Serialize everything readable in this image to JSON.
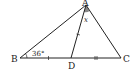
{
  "diagram": {
    "type": "geometry-triangle",
    "points": {
      "A": {
        "label": "A",
        "x": 86,
        "y": 5
      },
      "B": {
        "label": "B",
        "x": 20,
        "y": 58
      },
      "C": {
        "label": "C",
        "x": 121,
        "y": 58
      },
      "D": {
        "label": "D",
        "x": 71,
        "y": 58
      }
    },
    "segments": [
      "AB",
      "AC",
      "BC",
      "AD"
    ],
    "angle_labels": {
      "B": "36°",
      "A": "x"
    },
    "equal_marks": {
      "single_tick": [
        "AD",
        "BD"
      ],
      "double_tick": [
        "DC"
      ]
    },
    "colors": {
      "line": "#222222",
      "shade": "#888888",
      "background": "#ffffff"
    }
  }
}
